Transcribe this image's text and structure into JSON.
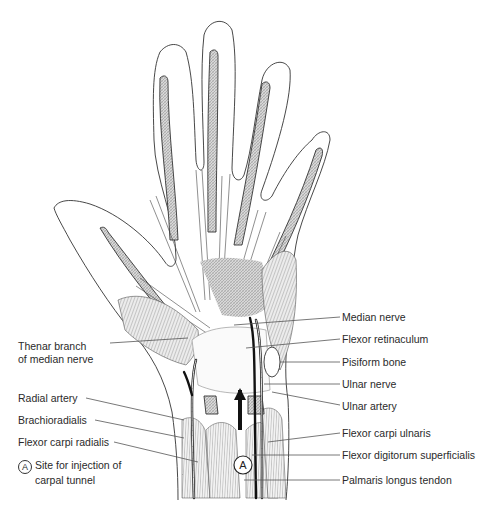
{
  "figure": {
    "marker": {
      "symbol": "A",
      "meaning": "Site for injection of carpal tunnel"
    }
  },
  "labels": {
    "left": [
      {
        "id": "thenar-branch",
        "line1": "Thenar branch",
        "line2": "of median nerve"
      },
      {
        "id": "radial-artery",
        "text": "Radial artery"
      },
      {
        "id": "brachioradialis",
        "text": "Brachioradialis"
      },
      {
        "id": "flexor-carpi-radialis",
        "text": "Flexor carpi radialis"
      },
      {
        "id": "injection-site",
        "symbol": "A",
        "line1": "Site for injection of",
        "line2": "carpal tunnel"
      }
    ],
    "right": [
      {
        "id": "median-nerve",
        "text": "Median nerve"
      },
      {
        "id": "flexor-retinaculum",
        "text": "Flexor retinaculum"
      },
      {
        "id": "pisiform-bone",
        "text": "Pisiform bone"
      },
      {
        "id": "ulnar-nerve",
        "text": "Ulnar nerve"
      },
      {
        "id": "ulnar-artery",
        "text": "Ulnar artery"
      },
      {
        "id": "flexor-carpi-ulnaris",
        "text": "Flexor carpi ulnaris"
      },
      {
        "id": "flexor-digitorum-superficialis",
        "text": "Flexor digitorum superficialis"
      },
      {
        "id": "palmaris-longus-tendon",
        "text": "Palmaris longus tendon"
      }
    ]
  },
  "colors": {
    "line": "#333333",
    "hatch": "#9a9a9a",
    "background": "#ffffff"
  }
}
